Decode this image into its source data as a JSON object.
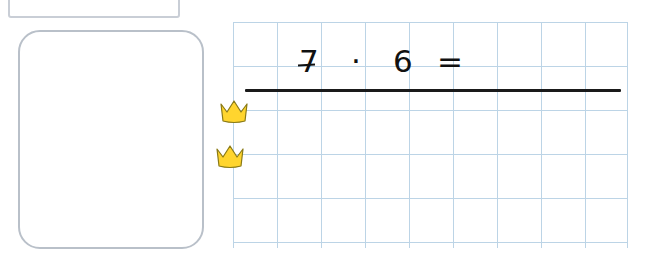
{
  "worksheet": {
    "top_box": {
      "name": "name-field-box"
    },
    "answer_box": {
      "name": "answer-area",
      "content": ""
    },
    "problem": {
      "factor_a": "7",
      "operator": "·",
      "factor_b": "6",
      "equals": "=",
      "answer": ""
    },
    "markers": [
      {
        "label": "crown-sticker-1"
      },
      {
        "label": "crown-sticker-2"
      }
    ],
    "grid": {
      "columns": 9,
      "rows": 5,
      "cell_size_px": 44,
      "line_color": "#bcd4e6"
    },
    "colors": {
      "grid_line": "#bcd4e6",
      "box_border": "#b9c0c9",
      "ink": "#111111",
      "sticker": "#ffd52e",
      "sticker_outline": "#8a7a16"
    }
  }
}
